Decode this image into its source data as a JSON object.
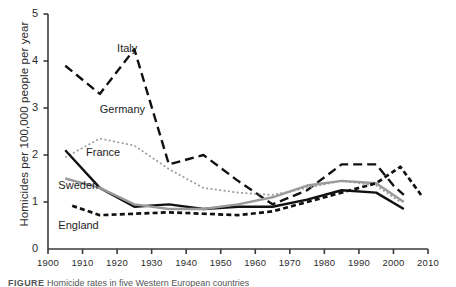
{
  "figure": {
    "caption_prefix": "FIGURE",
    "caption_text": "Homicide rates in five Western European countries"
  },
  "chart_data": {
    "type": "line",
    "title": "",
    "xlabel": "",
    "ylabel": "Homicides per 100,000 people per year",
    "xlim": [
      1900,
      2010
    ],
    "ylim": [
      0,
      5
    ],
    "xticks": [
      1900,
      1910,
      1920,
      1930,
      1940,
      1950,
      1960,
      1970,
      1980,
      1990,
      2000,
      2010
    ],
    "yticks": [
      0,
      1,
      2,
      3,
      4,
      5
    ],
    "grid": false,
    "legend_position": "inline-labels",
    "series": [
      {
        "name": "Italy",
        "style": "long-dash",
        "color": "#111111",
        "label_x": 1920,
        "label_y": 4.25,
        "x": [
          1905,
          1915,
          1925,
          1935,
          1945,
          1955,
          1965,
          1975,
          1985,
          1995,
          2000,
          2003
        ],
        "values": [
          3.9,
          3.3,
          4.25,
          1.8,
          2.0,
          1.45,
          0.95,
          1.25,
          1.8,
          1.8,
          1.35,
          1.15
        ]
      },
      {
        "name": "Germany",
        "style": "dotted",
        "color": "#9a9a9a",
        "label_x": 1915,
        "label_y": 2.95,
        "x": [
          1905,
          1915,
          1925,
          1935,
          1945,
          1955,
          1965,
          1975,
          1985,
          1995,
          2002
        ],
        "values": [
          1.95,
          2.35,
          2.2,
          1.7,
          1.3,
          1.2,
          1.15,
          1.3,
          1.45,
          1.35,
          1.0
        ]
      },
      {
        "name": "France",
        "style": "solid",
        "color": "#111111",
        "label_x": 1911,
        "label_y": 2.05,
        "x": [
          1905,
          1915,
          1925,
          1935,
          1945,
          1955,
          1965,
          1975,
          1985,
          1995,
          2003
        ],
        "values": [
          2.1,
          1.3,
          0.9,
          0.95,
          0.85,
          0.9,
          0.9,
          1.05,
          1.25,
          1.2,
          0.85
        ]
      },
      {
        "name": "Sweden",
        "style": "solid",
        "color": "#9a9a9a",
        "label_x": 1903,
        "label_y": 1.35,
        "x": [
          1905,
          1915,
          1925,
          1935,
          1945,
          1955,
          1965,
          1975,
          1985,
          1995,
          2003
        ],
        "values": [
          1.5,
          1.3,
          0.95,
          0.85,
          0.85,
          0.95,
          1.1,
          1.35,
          1.45,
          1.4,
          1.0
        ]
      },
      {
        "name": "England",
        "style": "short-dash",
        "color": "#111111",
        "label_x": 1903,
        "label_y": 0.5,
        "x": [
          1907,
          1915,
          1925,
          1935,
          1945,
          1955,
          1965,
          1975,
          1985,
          1995,
          2002,
          2008
        ],
        "values": [
          0.92,
          0.72,
          0.75,
          0.78,
          0.75,
          0.72,
          0.8,
          1.0,
          1.2,
          1.4,
          1.75,
          1.15
        ]
      }
    ]
  }
}
